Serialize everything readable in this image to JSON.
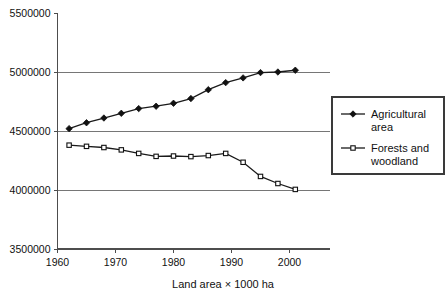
{
  "chart_data": {
    "type": "line",
    "title": "",
    "xlabel": "Land area × 1000 ha",
    "ylabel": "",
    "xlim": [
      1960,
      2005
    ],
    "ylim": [
      3500000,
      5500000
    ],
    "yticks": [
      3500000,
      4000000,
      4500000,
      5000000,
      5500000
    ],
    "ytick_labels": [
      "3500000",
      "4000000",
      "4500000",
      "5000000",
      "5500000"
    ],
    "xticks": [
      1960,
      1970,
      1980,
      1990,
      2000
    ],
    "xtick_labels": [
      "1960",
      "1970",
      "1980",
      "1990",
      "2000"
    ],
    "grid": "horizontal",
    "legend_position": "right",
    "series": [
      {
        "name": "Agricultural area",
        "marker": "diamond",
        "color": "#111111",
        "x": [
          1962,
          1965,
          1968,
          1971,
          1974,
          1977,
          1980,
          1983,
          1986,
          1989,
          1992,
          1995,
          1998,
          2001
        ],
        "values": [
          4520000,
          4570000,
          4610000,
          4650000,
          4690000,
          4710000,
          4735000,
          4775000,
          4850000,
          4910000,
          4950000,
          4995000,
          5000000,
          5015000
        ]
      },
      {
        "name": "Forests and woodland",
        "marker": "square",
        "color": "#111111",
        "x": [
          1962,
          1965,
          1968,
          1971,
          1974,
          1977,
          1980,
          1983,
          1986,
          1989,
          1992,
          1995,
          1998,
          2001
        ],
        "values": [
          4380000,
          4370000,
          4360000,
          4340000,
          4310000,
          4285000,
          4288000,
          4283000,
          4292000,
          4310000,
          4235000,
          4115000,
          4055000,
          4005000
        ]
      }
    ],
    "legend_entries": [
      {
        "label_line1": "Agricultural",
        "label_line2": "area",
        "marker": "diamond"
      },
      {
        "label_line1": "Forests and",
        "label_line2": "woodland",
        "marker": "square"
      }
    ]
  }
}
